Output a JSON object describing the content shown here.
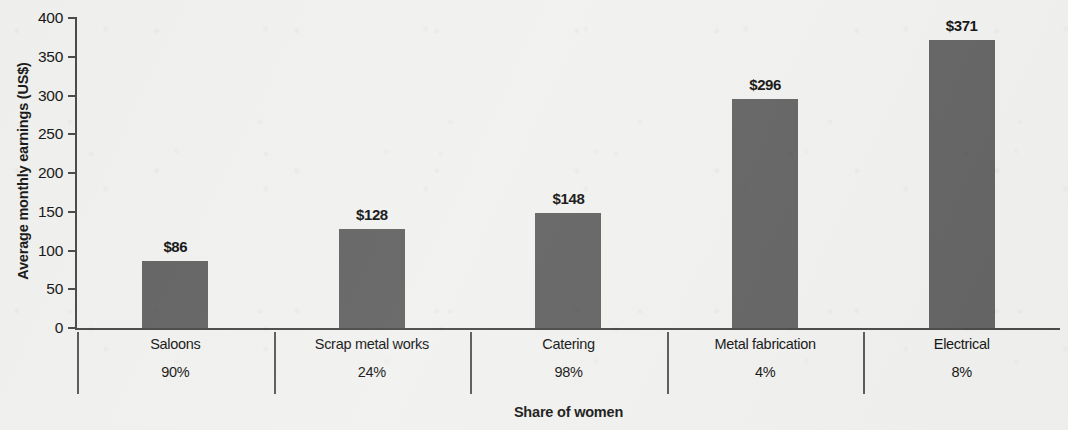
{
  "chart_data": {
    "type": "bar",
    "title": "",
    "xlabel": "Share of women",
    "ylabel": "Average monthly earnings (US$)",
    "categories": [
      "Saloons",
      "Scrap metal works",
      "Catering",
      "Metal fabrication",
      "Electrical"
    ],
    "values": [
      86,
      128,
      148,
      296,
      371
    ],
    "value_labels": [
      "$86",
      "$128",
      "$148",
      "$296",
      "$371"
    ],
    "share_of_women": [
      "90%",
      "24%",
      "98%",
      "4%",
      "8%"
    ],
    "ylim": [
      0,
      400
    ],
    "yticks": [
      0,
      50,
      100,
      150,
      200,
      250,
      300,
      350,
      400
    ],
    "ytick_labels": [
      "0",
      "50",
      "100",
      "150",
      "200",
      "250",
      "300",
      "350",
      "400"
    ],
    "grid": false,
    "legend": false,
    "series": [
      {
        "name": "Average monthly earnings (US$)",
        "values": [
          86,
          128,
          148,
          296,
          371
        ]
      }
    ],
    "colors": {
      "bar_fill": "#646464",
      "axis": "#4a4a4a",
      "text": "#161616",
      "background": "#f1f1ef"
    }
  }
}
